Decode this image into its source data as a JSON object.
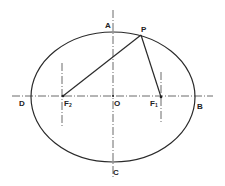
{
  "diagram": {
    "type": "ellipse-with-foci",
    "colors": {
      "stroke": "#2a2a2a",
      "background": "#ffffff"
    },
    "labels": {
      "A": "A",
      "B": "B",
      "C": "C",
      "D": "D",
      "O": "O",
      "P": "P",
      "F1": "F",
      "F1_sub": "1",
      "F2": "F",
      "F2_sub": "2"
    }
  }
}
